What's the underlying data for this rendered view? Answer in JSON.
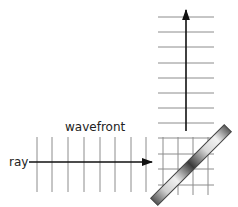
{
  "diagram": {
    "labels": {
      "ray": "ray",
      "wavefront": "wavefront"
    },
    "colors": {
      "wavefront_lines": "#8c8c8c",
      "ray": "#111111",
      "mirror_dark": "#4a4a4a",
      "mirror_light": "#e8e8e8",
      "text": "#222222"
    },
    "incident": {
      "wavefront_x": [
        37,
        52,
        68,
        84,
        100,
        115,
        131,
        146
      ],
      "wavefront_y_range": [
        137,
        192
      ],
      "ray": {
        "x1": 29,
        "x2": 152,
        "y": 162,
        "direction": "right"
      }
    },
    "reflected": {
      "wavefront_y": [
        17,
        32,
        47,
        63,
        78,
        93,
        108,
        123
      ],
      "wavefront_x_range": [
        158,
        214
      ],
      "ray": {
        "x": 186,
        "y1": 131,
        "y2": 10,
        "direction": "up"
      }
    },
    "overlap_grid": {
      "h_lines_y": [
        138,
        154,
        169,
        185
      ],
      "v_lines_x": [
        163,
        178,
        193,
        208
      ]
    },
    "mirror": {
      "center": [
        191,
        165
      ],
      "length": 104,
      "thickness": 10,
      "angle_deg": -45
    }
  }
}
